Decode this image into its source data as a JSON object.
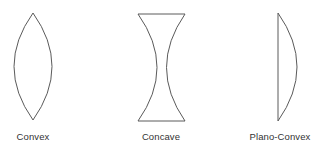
{
  "diagram": {
    "stroke_color": "#5a5a5a",
    "label_color": "#333333",
    "lenses": [
      {
        "id": "convex",
        "label": "Convex",
        "label_x": 33,
        "shape": {
          "top": [
            33,
            13
          ],
          "bottom": [
            33,
            120
          ],
          "left_extreme_x": 14,
          "right_extreme_x": 52
        }
      },
      {
        "id": "concave",
        "label": "Concave",
        "label_x": 161,
        "shape": {
          "top_left": [
            138,
            14
          ],
          "top_right": [
            185,
            14
          ],
          "bottom_left": [
            138,
            121
          ],
          "bottom_right": [
            185,
            121
          ],
          "waist_left_x": 157,
          "waist_right_x": 167
        }
      },
      {
        "id": "plano-convex",
        "label": "Plano-Convex",
        "label_x": 280,
        "shape": {
          "flat_x": 278,
          "top_y": 13,
          "bottom_y": 121,
          "arc_extreme_x": 297
        }
      }
    ]
  }
}
